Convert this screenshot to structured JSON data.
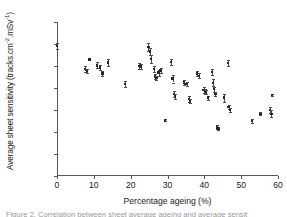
{
  "figure": {
    "caption": "Figure 2. Correlation between sheet average ageing and average sensit"
  },
  "chart_data": {
    "type": "scatter",
    "title": "",
    "xlabel": "Percentage ageing (%)",
    "ylabel": "Average sheet sensitivity (tracks.cm",
    "ylabel_sup1": "-2",
    "ylabel_mid": ".mSv",
    "ylabel_sup2": "-1",
    "ylabel_end": ")",
    "ylabel_plain": "Average sheet sensitivity (tracks.cm-2.mSv-1)",
    "xlim": [
      0,
      60
    ],
    "ylim": [
      0,
      700
    ],
    "xticks": [
      0,
      10,
      20,
      30,
      40,
      50,
      60
    ],
    "yticks": [
      0,
      100,
      200,
      300,
      400,
      500,
      600,
      700
    ],
    "grid": false,
    "legend": "none",
    "marker_color": "#262626",
    "errorbar_color": "#4c4c4c",
    "axis_color": "#555555",
    "points": [
      {
        "x": 0.0,
        "y": 592,
        "yerr": 14
      },
      {
        "x": 7.6,
        "y": 487,
        "yerr": 12
      },
      {
        "x": 8.1,
        "y": 477,
        "yerr": 10
      },
      {
        "x": 8.8,
        "y": 530,
        "yerr": 4
      },
      {
        "x": 10.8,
        "y": 503,
        "yerr": 14
      },
      {
        "x": 11.6,
        "y": 493,
        "yerr": 13
      },
      {
        "x": 12.3,
        "y": 466,
        "yerr": 11
      },
      {
        "x": 13.9,
        "y": 516,
        "yerr": 14
      },
      {
        "x": 18.5,
        "y": 418,
        "yerr": 13
      },
      {
        "x": 22.3,
        "y": 500,
        "yerr": 13
      },
      {
        "x": 22.8,
        "y": 497,
        "yerr": 11
      },
      {
        "x": 24.8,
        "y": 586,
        "yerr": 17
      },
      {
        "x": 25.2,
        "y": 566,
        "yerr": 14
      },
      {
        "x": 25.6,
        "y": 532,
        "yerr": 18
      },
      {
        "x": 26.3,
        "y": 486,
        "yerr": 13
      },
      {
        "x": 26.6,
        "y": 452,
        "yerr": 11
      },
      {
        "x": 27.0,
        "y": 445,
        "yerr": 10
      },
      {
        "x": 27.6,
        "y": 470,
        "yerr": 14
      },
      {
        "x": 28.1,
        "y": 480,
        "yerr": 11
      },
      {
        "x": 29.4,
        "y": 253,
        "yerr": 4
      },
      {
        "x": 30.9,
        "y": 517,
        "yerr": 14
      },
      {
        "x": 31.4,
        "y": 443,
        "yerr": 18
      },
      {
        "x": 31.8,
        "y": 374,
        "yerr": 13
      },
      {
        "x": 32.0,
        "y": 363,
        "yerr": 11
      },
      {
        "x": 34.5,
        "y": 425,
        "yerr": 11
      },
      {
        "x": 35.2,
        "y": 419,
        "yerr": 10
      },
      {
        "x": 35.8,
        "y": 350,
        "yerr": 13
      },
      {
        "x": 36.1,
        "y": 342,
        "yerr": 9
      },
      {
        "x": 38.0,
        "y": 466,
        "yerr": 13
      },
      {
        "x": 38.6,
        "y": 455,
        "yerr": 11
      },
      {
        "x": 39.8,
        "y": 391,
        "yerr": 12
      },
      {
        "x": 40.1,
        "y": 386,
        "yerr": 11
      },
      {
        "x": 40.4,
        "y": 382,
        "yerr": 10
      },
      {
        "x": 41.0,
        "y": 356,
        "yerr": 9
      },
      {
        "x": 42.0,
        "y": 474,
        "yerr": 13
      },
      {
        "x": 42.3,
        "y": 424,
        "yerr": 16
      },
      {
        "x": 42.6,
        "y": 395,
        "yerr": 11
      },
      {
        "x": 43.0,
        "y": 373,
        "yerr": 11
      },
      {
        "x": 43.5,
        "y": 221,
        "yerr": 9
      },
      {
        "x": 43.8,
        "y": 216,
        "yerr": 7
      },
      {
        "x": 45.4,
        "y": 356,
        "yerr": 18
      },
      {
        "x": 46.4,
        "y": 515,
        "yerr": 13
      },
      {
        "x": 46.6,
        "y": 314,
        "yerr": 11
      },
      {
        "x": 46.9,
        "y": 301,
        "yerr": 9
      },
      {
        "x": 53.0,
        "y": 250,
        "yerr": 11
      },
      {
        "x": 55.2,
        "y": 283,
        "yerr": 7
      },
      {
        "x": 57.9,
        "y": 300,
        "yerr": 13
      },
      {
        "x": 58.2,
        "y": 283,
        "yerr": 16
      },
      {
        "x": 58.4,
        "y": 368,
        "yerr": 5
      }
    ]
  }
}
